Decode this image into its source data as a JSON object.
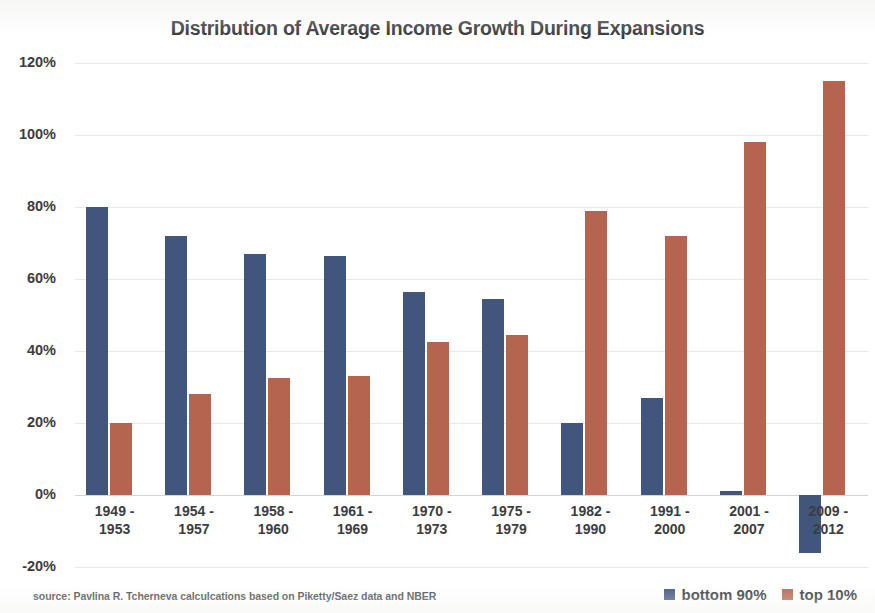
{
  "chart_data": {
    "type": "bar",
    "title": "Distribution of Average Income Growth During Expansions",
    "xlabel": "",
    "ylabel": "",
    "ylim": [
      -20,
      120
    ],
    "yticks": [
      "-20%",
      "0%",
      "20%",
      "40%",
      "60%",
      "80%",
      "100%",
      "120%"
    ],
    "ytick_values": [
      -20,
      0,
      20,
      40,
      60,
      80,
      100,
      120
    ],
    "grid": true,
    "legend_position": "bottom-right",
    "categories": [
      "1949 - 1953",
      "1954 - 1957",
      "1958 - 1960",
      "1961 - 1969",
      "1970 - 1973",
      "1975 - 1979",
      "1982 - 1990",
      "1991 - 2000",
      "2001 - 2007",
      "2009 - 2012"
    ],
    "category_lines": [
      [
        "1949 -",
        "1953"
      ],
      [
        "1954 -",
        "1957"
      ],
      [
        "1958 -",
        "1960"
      ],
      [
        "1961 -",
        "1969"
      ],
      [
        "1970 -",
        "1973"
      ],
      [
        "1975 -",
        "1979"
      ],
      [
        "1982 -",
        "1990"
      ],
      [
        "1991 -",
        "2000"
      ],
      [
        "2001 -",
        "2007"
      ],
      [
        "2009 -",
        "2012"
      ]
    ],
    "series": [
      {
        "name": "bottom 90%",
        "color": "#41567d",
        "values": [
          80,
          72,
          67,
          66.5,
          56.5,
          54.5,
          20,
          27,
          1,
          -16
        ]
      },
      {
        "name": "top 10%",
        "color": "#b4644f",
        "values": [
          20,
          28,
          32.5,
          33,
          42.5,
          44.5,
          79,
          72,
          98,
          115
        ]
      }
    ],
    "source": "source: Pavlina R. Tcherneva calculcations based on Piketty/Saez data and NBER"
  },
  "legend": {
    "items": [
      {
        "label": "bottom 90%",
        "color": "#41567d"
      },
      {
        "label": "top 10%",
        "color": "#b4644f"
      }
    ]
  }
}
